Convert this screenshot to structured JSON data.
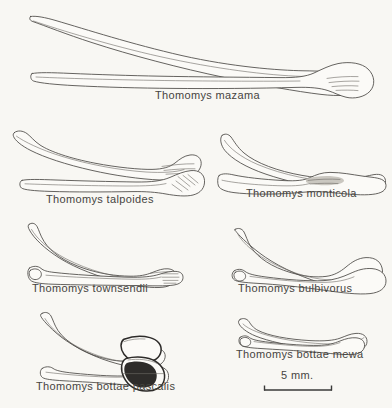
{
  "figure": {
    "background_color": "#f8f7f3",
    "ink_color": "#4a4845",
    "label_color": "#46443f",
    "title": "",
    "view_note_lateral": "lateral view",
    "view_note_ventral": "ventral view"
  },
  "specimens": [
    {
      "id": "mazama",
      "label": "Thomomys mazama",
      "label_x": 155,
      "label_y": 96,
      "column": "full",
      "views": 2
    },
    {
      "id": "talpoides",
      "label": "Thomomys talpoides",
      "label_x": 46,
      "label_y": 199,
      "column": "left",
      "views": 2
    },
    {
      "id": "monticola",
      "label": "Thomomys monticola",
      "label_x": 246,
      "label_y": 193,
      "column": "right",
      "views": 2
    },
    {
      "id": "townsendii",
      "label": "Thomomys townsendii",
      "label_x": 32,
      "label_y": 288,
      "column": "left",
      "views": 2
    },
    {
      "id": "bulbivorus",
      "label": "Thomomys bulbivorus",
      "label_x": 238,
      "label_y": 288,
      "column": "right",
      "views": 2
    },
    {
      "id": "bottae-pascalis",
      "label": "Thomomys bottae pascalis",
      "label_x": 36,
      "label_y": 385,
      "column": "left",
      "views": 2
    },
    {
      "id": "bottae-mewa",
      "label": "Thomomys bottae mewa",
      "label_x": 236,
      "label_y": 353,
      "column": "right",
      "views": 2
    }
  ],
  "scale_bar": {
    "label": "5 mm.",
    "label_x": 288,
    "label_y": 374,
    "bar_x1": 264,
    "bar_x2": 332,
    "bar_y": 390,
    "tick_height": 5
  }
}
